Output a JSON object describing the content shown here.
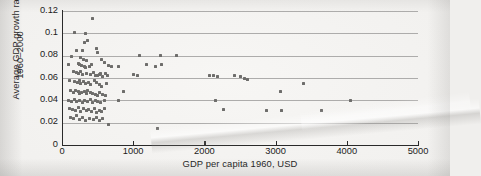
{
  "chart_data": {
    "type": "scatter",
    "title": "",
    "xlabel": "GDP per capita 1960, USD",
    "ylabel_line1": "Average GDP growth rates",
    "ylabel_line2": "1960–2000",
    "xlim": [
      0,
      5000
    ],
    "ylim": [
      0,
      0.12
    ],
    "xticks": [
      0,
      1000,
      2000,
      3000,
      4000,
      5000
    ],
    "xtick_labels": [
      "0",
      "1000",
      "2000",
      "3000",
      "4000",
      "5000"
    ],
    "yticks": [
      0,
      0.02,
      0.04,
      0.06,
      0.08,
      0.1,
      0.12
    ],
    "ytick_labels": [
      "0",
      "0.02",
      "0.04",
      "0.06",
      "0.08",
      "0.1",
      "0.12"
    ],
    "grid": "horizontal",
    "legend": "none",
    "marker_color": "#6e6d6b",
    "points": [
      [
        430,
        0.113
      ],
      [
        175,
        0.101
      ],
      [
        330,
        0.1
      ],
      [
        360,
        0.094
      ],
      [
        310,
        0.092
      ],
      [
        210,
        0.085
      ],
      [
        290,
        0.085
      ],
      [
        490,
        0.086
      ],
      [
        505,
        0.083
      ],
      [
        1090,
        0.08
      ],
      [
        1390,
        0.08
      ],
      [
        1610,
        0.08
      ],
      [
        140,
        0.079
      ],
      [
        265,
        0.078
      ],
      [
        300,
        0.077
      ],
      [
        345,
        0.076
      ],
      [
        560,
        0.077
      ],
      [
        600,
        0.074
      ],
      [
        95,
        0.072
      ],
      [
        225,
        0.073
      ],
      [
        250,
        0.072
      ],
      [
        270,
        0.071
      ],
      [
        315,
        0.07
      ],
      [
        330,
        0.069
      ],
      [
        380,
        0.07
      ],
      [
        420,
        0.072
      ],
      [
        660,
        0.071
      ],
      [
        700,
        0.07
      ],
      [
        790,
        0.07
      ],
      [
        1180,
        0.072
      ],
      [
        1320,
        0.07
      ],
      [
        1395,
        0.072
      ],
      [
        155,
        0.066
      ],
      [
        200,
        0.065
      ],
      [
        235,
        0.064
      ],
      [
        255,
        0.066
      ],
      [
        290,
        0.063
      ],
      [
        345,
        0.064
      ],
      [
        400,
        0.063
      ],
      [
        440,
        0.065
      ],
      [
        470,
        0.062
      ],
      [
        500,
        0.062
      ],
      [
        520,
        0.063
      ],
      [
        545,
        0.064
      ],
      [
        565,
        0.061
      ],
      [
        610,
        0.064
      ],
      [
        640,
        0.062
      ],
      [
        1000,
        0.063
      ],
      [
        1055,
        0.062
      ],
      [
        2070,
        0.062
      ],
      [
        2130,
        0.062
      ],
      [
        2180,
        0.061
      ],
      [
        2420,
        0.062
      ],
      [
        2500,
        0.061
      ],
      [
        2560,
        0.06
      ],
      [
        2600,
        0.059
      ],
      [
        110,
        0.058
      ],
      [
        170,
        0.057
      ],
      [
        215,
        0.056
      ],
      [
        240,
        0.058
      ],
      [
        265,
        0.055
      ],
      [
        300,
        0.057
      ],
      [
        330,
        0.055
      ],
      [
        370,
        0.056
      ],
      [
        405,
        0.054
      ],
      [
        455,
        0.058
      ],
      [
        490,
        0.056
      ],
      [
        520,
        0.054
      ],
      [
        560,
        0.052
      ],
      [
        620,
        0.055
      ],
      [
        3390,
        0.055
      ],
      [
        125,
        0.049
      ],
      [
        160,
        0.047
      ],
      [
        195,
        0.049
      ],
      [
        225,
        0.048
      ],
      [
        250,
        0.046
      ],
      [
        280,
        0.047
      ],
      [
        310,
        0.048
      ],
      [
        340,
        0.046
      ],
      [
        365,
        0.049
      ],
      [
        395,
        0.047
      ],
      [
        430,
        0.046
      ],
      [
        465,
        0.045
      ],
      [
        500,
        0.044
      ],
      [
        530,
        0.047
      ],
      [
        575,
        0.045
      ],
      [
        610,
        0.044
      ],
      [
        860,
        0.048
      ],
      [
        3070,
        0.048
      ],
      [
        85,
        0.04
      ],
      [
        130,
        0.039
      ],
      [
        175,
        0.041
      ],
      [
        210,
        0.039
      ],
      [
        245,
        0.04
      ],
      [
        285,
        0.038
      ],
      [
        320,
        0.04
      ],
      [
        360,
        0.039
      ],
      [
        395,
        0.041
      ],
      [
        430,
        0.038
      ],
      [
        470,
        0.04
      ],
      [
        505,
        0.039
      ],
      [
        545,
        0.038
      ],
      [
        590,
        0.04
      ],
      [
        800,
        0.04
      ],
      [
        2150,
        0.04
      ],
      [
        4050,
        0.04
      ],
      [
        100,
        0.033
      ],
      [
        150,
        0.032
      ],
      [
        190,
        0.031
      ],
      [
        230,
        0.034
      ],
      [
        265,
        0.03
      ],
      [
        300,
        0.033
      ],
      [
        340,
        0.031
      ],
      [
        375,
        0.032
      ],
      [
        410,
        0.03
      ],
      [
        450,
        0.033
      ],
      [
        490,
        0.029
      ],
      [
        525,
        0.031
      ],
      [
        560,
        0.03
      ],
      [
        595,
        0.033
      ],
      [
        2270,
        0.032
      ],
      [
        2870,
        0.031
      ],
      [
        3080,
        0.031
      ],
      [
        3650,
        0.031
      ],
      [
        120,
        0.025
      ],
      [
        165,
        0.024
      ],
      [
        200,
        0.026
      ],
      [
        240,
        0.023
      ],
      [
        285,
        0.025
      ],
      [
        330,
        0.022
      ],
      [
        390,
        0.024
      ],
      [
        440,
        0.023
      ],
      [
        480,
        0.025
      ],
      [
        530,
        0.022
      ],
      [
        575,
        0.024
      ],
      [
        660,
        0.018
      ],
      [
        1340,
        0.015
      ]
    ]
  }
}
